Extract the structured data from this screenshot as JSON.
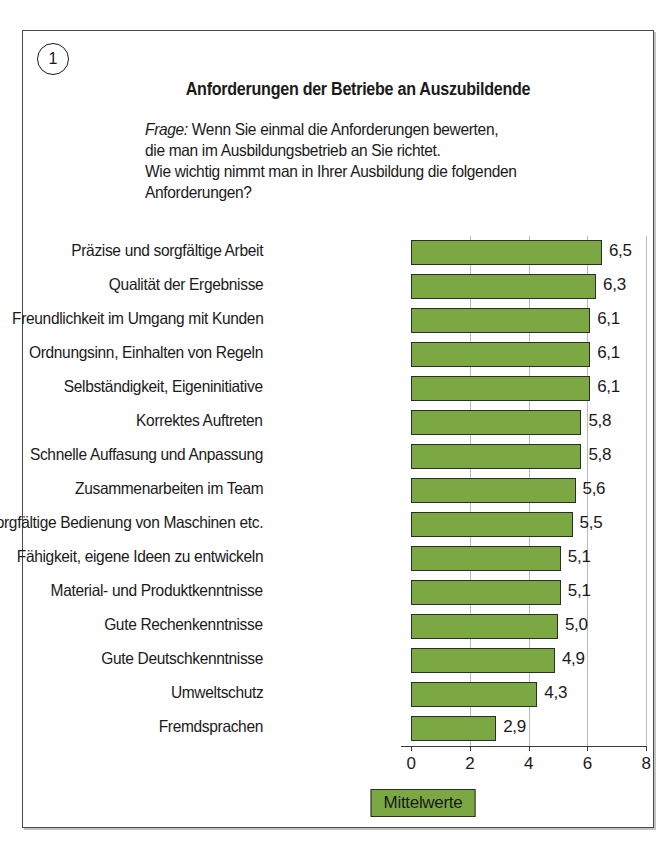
{
  "figure": {
    "badge_number": "1",
    "title": "Anforderungen der Betriebe an Auszubildende",
    "question_lead": "Frage:",
    "question_line1": " Wenn Sie einmal die Anforderungen bewerten,",
    "question_line2": "die man im Ausbildungsbetrieb an Sie richtet.",
    "question_line3": "Wie wichtig nimmt man in Ihrer Ausbildung die folgenden",
    "question_line4": "Anforderungen?",
    "legend_label": "Mittelwerte"
  },
  "colors": {
    "bar_fill": "#7ba843",
    "bar_stroke": "#2c2c2c",
    "frame": "#4a4a4a",
    "gridline": "#b9b9b9",
    "text": "#1a1a1a"
  },
  "chart_data": {
    "type": "bar",
    "orientation": "horizontal",
    "title": "Anforderungen der Betriebe an Auszubildende",
    "subtitle": "Frage: Wenn Sie einmal die Anforderungen bewerten, die man im Ausbildungsbetrieb an Sie richtet. Wie wichtig nimmt man in Ihrer Ausbildung die folgenden Anforderungen?",
    "xlabel": "",
    "ylabel": "",
    "xlim": [
      0,
      8
    ],
    "xticks": [
      "0",
      "2",
      "4",
      "6",
      "8"
    ],
    "xtick_values": [
      0,
      2,
      4,
      6,
      8
    ],
    "grid": true,
    "legend": [
      "Mittelwerte"
    ],
    "legend_position": "bottom-center",
    "categories": [
      "Präzise und sorgfältige Arbeit",
      "Qualität der Ergebnisse",
      "Freundlichkeit im Umgang mit Kunden",
      "Ordnungsinn, Einhalten von Regeln",
      "Selbständigkeit, Eigeninitiative",
      "Korrektes Auftreten",
      "Schnelle Auffasung und Anpassung",
      "Zusammenarbeiten im Team",
      "Sorgfältige Bedienung von Maschinen etc.",
      "Fähigkeit, eigene Ideen zu entwickeln",
      "Material- und Produktkenntnisse",
      "Gute Rechenkenntnisse",
      "Gute Deutschkenntnisse",
      "Umweltschutz",
      "Fremdsprachen"
    ],
    "values": [
      6.5,
      6.3,
      6.1,
      6.1,
      6.1,
      5.8,
      5.8,
      5.6,
      5.5,
      5.1,
      5.1,
      5.0,
      4.9,
      4.3,
      2.9
    ],
    "value_labels": [
      "6,5",
      "6,3",
      "6,1",
      "6,1",
      "6,1",
      "5,8",
      "5,8",
      "5,6",
      "5,5",
      "5,1",
      "5,1",
      "5,0",
      "4,9",
      "4,3",
      "2,9"
    ]
  }
}
